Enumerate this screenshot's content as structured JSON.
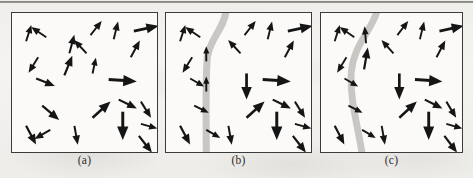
{
  "figure": {
    "type": "vector-field-panels",
    "panel_count": 3,
    "background_color": "#f2f1ee",
    "panel_background": "#fbfaf8",
    "panel_border_color": "#3b3b3b",
    "arrow_color": "#151515",
    "band_color": "#c9c7c3",
    "top_rule": true
  },
  "captions": {
    "a": "(a)",
    "b": "(b)",
    "c": "(c)"
  },
  "panels": [
    {
      "id": "a",
      "label": "(a)",
      "has_band": false,
      "band": null,
      "arrows": [
        {
          "x": 14,
          "y": 28,
          "len": 17,
          "angle": -72
        },
        {
          "x": 34,
          "y": 24,
          "len": 18,
          "angle": -146
        },
        {
          "x": 78,
          "y": 22,
          "len": 18,
          "angle": -52
        },
        {
          "x": 101,
          "y": 26,
          "len": 18,
          "angle": -76
        },
        {
          "x": 121,
          "y": 18,
          "len": 25,
          "angle": -12
        },
        {
          "x": 57,
          "y": 40,
          "len": 19,
          "angle": -75
        },
        {
          "x": 74,
          "y": 40,
          "len": 18,
          "angle": -133
        },
        {
          "x": 118,
          "y": 44,
          "len": 19,
          "angle": -62
        },
        {
          "x": 26,
          "y": 44,
          "len": 18,
          "angle": 122
        },
        {
          "x": 24,
          "y": 65,
          "len": 20,
          "angle": 22
        },
        {
          "x": 52,
          "y": 62,
          "len": 21,
          "angle": -68
        },
        {
          "x": 80,
          "y": 60,
          "len": 16,
          "angle": -78
        },
        {
          "x": 96,
          "y": 66,
          "len": 28,
          "angle": 4
        },
        {
          "x": 106,
          "y": 86,
          "len": 20,
          "angle": 26
        },
        {
          "x": 128,
          "y": 88,
          "len": 19,
          "angle": 58
        },
        {
          "x": 30,
          "y": 92,
          "len": 22,
          "angle": 40
        },
        {
          "x": 80,
          "y": 104,
          "len": 24,
          "angle": -42
        },
        {
          "x": 110,
          "y": 98,
          "len": 28,
          "angle": 90
        },
        {
          "x": 128,
          "y": 110,
          "len": 17,
          "angle": 16
        },
        {
          "x": 14,
          "y": 112,
          "len": 21,
          "angle": 62
        },
        {
          "x": 38,
          "y": 116,
          "len": 18,
          "angle": 150
        },
        {
          "x": 62,
          "y": 112,
          "len": 19,
          "angle": 80
        },
        {
          "x": 126,
          "y": 122,
          "len": 21,
          "angle": 52
        }
      ]
    },
    {
      "id": "b",
      "label": "(b)",
      "has_band": true,
      "band": {
        "shape": "curved-vertical",
        "width": 7,
        "description": "gray band entering top near x=60, curving left to x=40 and running down to bottom"
      },
      "arrows": [
        {
          "x": 14,
          "y": 28,
          "len": 17,
          "angle": -72
        },
        {
          "x": 34,
          "y": 24,
          "len": 18,
          "angle": -146
        },
        {
          "x": 78,
          "y": 22,
          "len": 18,
          "angle": -52
        },
        {
          "x": 101,
          "y": 26,
          "len": 18,
          "angle": -76
        },
        {
          "x": 121,
          "y": 18,
          "len": 25,
          "angle": -12
        },
        {
          "x": 40,
          "y": 48,
          "len": 15,
          "angle": -90
        },
        {
          "x": 74,
          "y": 40,
          "len": 18,
          "angle": -133
        },
        {
          "x": 118,
          "y": 44,
          "len": 19,
          "angle": -62
        },
        {
          "x": 26,
          "y": 44,
          "len": 18,
          "angle": 122
        },
        {
          "x": 24,
          "y": 65,
          "len": 16,
          "angle": 30
        },
        {
          "x": 40,
          "y": 78,
          "len": 15,
          "angle": -90
        },
        {
          "x": 80,
          "y": 60,
          "len": 26,
          "angle": 90
        },
        {
          "x": 96,
          "y": 66,
          "len": 28,
          "angle": 4
        },
        {
          "x": 106,
          "y": 86,
          "len": 20,
          "angle": 26
        },
        {
          "x": 128,
          "y": 88,
          "len": 19,
          "angle": 58
        },
        {
          "x": 28,
          "y": 92,
          "len": 16,
          "angle": 26
        },
        {
          "x": 80,
          "y": 104,
          "len": 24,
          "angle": -42
        },
        {
          "x": 110,
          "y": 98,
          "len": 28,
          "angle": 90
        },
        {
          "x": 128,
          "y": 110,
          "len": 17,
          "angle": 16
        },
        {
          "x": 14,
          "y": 112,
          "len": 21,
          "angle": 62
        },
        {
          "x": 40,
          "y": 116,
          "len": 16,
          "angle": 30
        },
        {
          "x": 62,
          "y": 112,
          "len": 19,
          "angle": 80
        },
        {
          "x": 126,
          "y": 122,
          "len": 21,
          "angle": 52
        }
      ]
    },
    {
      "id": "c",
      "label": "(c)",
      "has_band": true,
      "band": {
        "shape": "curved-vertical",
        "width": 7,
        "description": "gray band entering top near x=58, bowing left through x=32 mid-panel and exiting bottom near x=42"
      },
      "arrows": [
        {
          "x": 14,
          "y": 28,
          "len": 17,
          "angle": -72
        },
        {
          "x": 34,
          "y": 24,
          "len": 18,
          "angle": -146
        },
        {
          "x": 78,
          "y": 22,
          "len": 18,
          "angle": -52
        },
        {
          "x": 101,
          "y": 26,
          "len": 18,
          "angle": -76
        },
        {
          "x": 121,
          "y": 18,
          "len": 25,
          "angle": -12
        },
        {
          "x": 46,
          "y": 30,
          "len": 17,
          "angle": -95
        },
        {
          "x": 74,
          "y": 40,
          "len": 18,
          "angle": -133
        },
        {
          "x": 118,
          "y": 44,
          "len": 19,
          "angle": -62
        },
        {
          "x": 26,
          "y": 44,
          "len": 18,
          "angle": 122
        },
        {
          "x": 24,
          "y": 65,
          "len": 16,
          "angle": 30
        },
        {
          "x": 44,
          "y": 56,
          "len": 22,
          "angle": -80
        },
        {
          "x": 80,
          "y": 60,
          "len": 26,
          "angle": 90
        },
        {
          "x": 96,
          "y": 66,
          "len": 28,
          "angle": 4
        },
        {
          "x": 106,
          "y": 86,
          "len": 20,
          "angle": 26
        },
        {
          "x": 128,
          "y": 88,
          "len": 19,
          "angle": 58
        },
        {
          "x": 28,
          "y": 92,
          "len": 16,
          "angle": 26
        },
        {
          "x": 80,
          "y": 104,
          "len": 24,
          "angle": -42
        },
        {
          "x": 110,
          "y": 98,
          "len": 28,
          "angle": 90
        },
        {
          "x": 128,
          "y": 110,
          "len": 17,
          "angle": 16
        },
        {
          "x": 14,
          "y": 112,
          "len": 21,
          "angle": 62
        },
        {
          "x": 42,
          "y": 116,
          "len": 16,
          "angle": 30
        },
        {
          "x": 62,
          "y": 112,
          "len": 19,
          "angle": 80
        },
        {
          "x": 126,
          "y": 122,
          "len": 21,
          "angle": 52
        }
      ]
    }
  ]
}
